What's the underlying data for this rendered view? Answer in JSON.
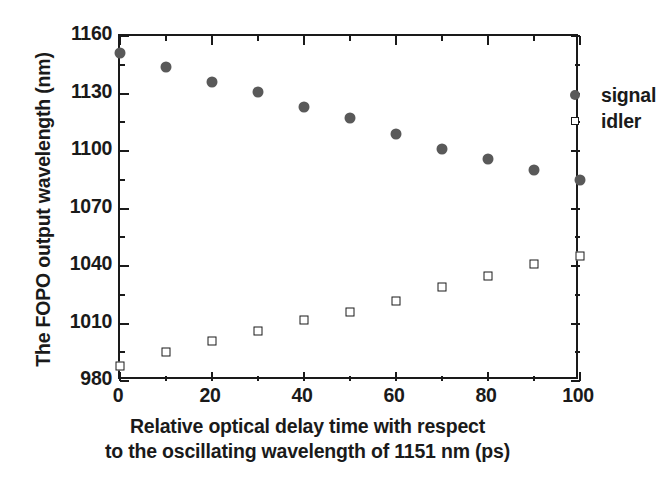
{
  "chart_data": {
    "type": "scatter",
    "title": "",
    "xlabel_lines": [
      "Relative optical delay time with respect",
      "to the oscillating wavelength of 1151 nm (ps)"
    ],
    "xlabel": "Relative optical delay time with respect to the oscillating wavelength of 1151 nm (ps)",
    "ylabel": "The FOPO output wavelength (nm)",
    "xlim": [
      0,
      100
    ],
    "ylim": [
      980,
      1160
    ],
    "xticks": [
      0,
      20,
      40,
      60,
      80,
      100
    ],
    "xtick_labels": [
      "0",
      "20",
      "40",
      "60",
      "80",
      "100"
    ],
    "xminor_step": 10,
    "yticks": [
      980,
      1010,
      1040,
      1070,
      1100,
      1130,
      1160
    ],
    "ytick_labels": [
      "980",
      "1010",
      "1040",
      "1070",
      "1100",
      "1130",
      "1160"
    ],
    "yminor_step": 15,
    "grid": false,
    "legend_position": "top-right",
    "frame": "box",
    "tick_direction": "in",
    "x": [
      0,
      10,
      20,
      30,
      40,
      50,
      60,
      70,
      80,
      90,
      100
    ],
    "series": [
      {
        "name": "signal",
        "marker": "filled-circle",
        "color": "#595959",
        "values": [
          1151,
          1144,
          1136,
          1131,
          1123,
          1117,
          1109,
          1101,
          1096,
          1090,
          1085
        ]
      },
      {
        "name": "idler",
        "marker": "open-square",
        "color": "#1a1a1a",
        "values": [
          988,
          995,
          1001,
          1006,
          1012,
          1016,
          1022,
          1029,
          1035,
          1041,
          1045
        ]
      }
    ]
  },
  "legend": {
    "entries": [
      {
        "label": "signal",
        "marker": "filled-circle"
      },
      {
        "label": "idler",
        "marker": "open-square"
      }
    ]
  },
  "colors": {
    "signal_marker": "#595959",
    "idler_marker": "#1a1a1a",
    "axis": "#1a1a1a",
    "background": "#ffffff"
  }
}
